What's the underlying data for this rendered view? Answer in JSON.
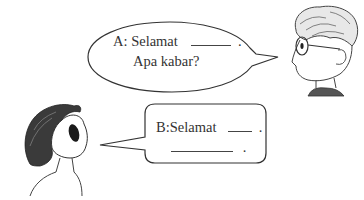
{
  "dialogue": {
    "speaker_a": {
      "line1": "A: Selamat",
      "line1_end": ".",
      "line2": "Apa kabar?"
    },
    "speaker_b": {
      "line1": "B:Selamat",
      "line1_end": ".",
      "line2_end": "."
    }
  },
  "characters": [
    {
      "id": "boy-with-glasses",
      "position": "top-right",
      "speaks": "A"
    },
    {
      "id": "girl-long-hair",
      "position": "bottom-left",
      "speaks": "B"
    }
  ],
  "colors": {
    "line": "#333333",
    "background": "#ffffff"
  }
}
